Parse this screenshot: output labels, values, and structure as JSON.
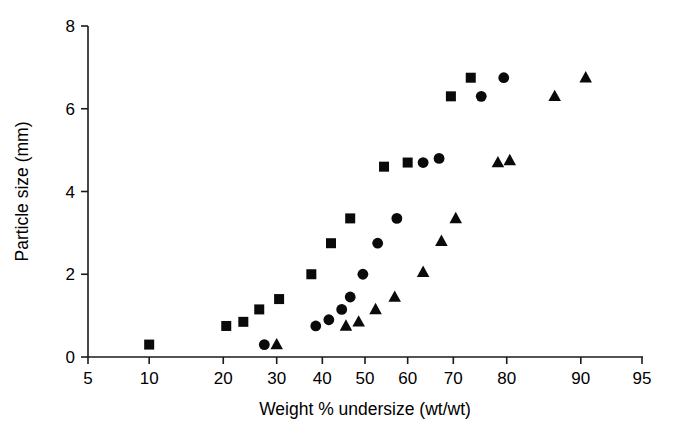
{
  "chart_data": {
    "type": "scatter",
    "title": "",
    "xlabel": "Weight % undersize (wt/wt)",
    "ylabel": "Particle size (mm)",
    "xscale": "probability",
    "xlim": [
      5,
      95
    ],
    "ylim": [
      0,
      8
    ],
    "xticks": [
      5,
      10,
      20,
      30,
      40,
      50,
      60,
      70,
      80,
      90,
      95
    ],
    "xticklabels": [
      "5",
      "10",
      "20",
      "30",
      "40",
      "50",
      "60",
      "70",
      "80",
      "90",
      "95"
    ],
    "yticks": [
      0,
      2,
      4,
      6,
      8
    ],
    "yticklabels": [
      "0",
      "2",
      "4",
      "6",
      "8"
    ],
    "grid": false,
    "legend": null,
    "series": [
      {
        "name": "square-series",
        "marker": "square",
        "color": "#0a0a0a",
        "points": [
          {
            "x": 10.0,
            "y": 0.3
          },
          {
            "x": 20.5,
            "y": 0.75
          },
          {
            "x": 23.5,
            "y": 0.85
          },
          {
            "x": 26.5,
            "y": 1.15
          },
          {
            "x": 30.5,
            "y": 1.4
          },
          {
            "x": 37.5,
            "y": 2.0
          },
          {
            "x": 42.0,
            "y": 2.75
          },
          {
            "x": 46.5,
            "y": 3.35
          },
          {
            "x": 54.5,
            "y": 4.6
          },
          {
            "x": 60.0,
            "y": 4.7
          },
          {
            "x": 69.5,
            "y": 6.3
          },
          {
            "x": 73.5,
            "y": 6.75
          }
        ]
      },
      {
        "name": "circle-series",
        "marker": "circle",
        "color": "#0a0a0a",
        "points": [
          {
            "x": 27.5,
            "y": 0.3
          },
          {
            "x": 38.5,
            "y": 0.75
          },
          {
            "x": 41.5,
            "y": 0.9
          },
          {
            "x": 44.5,
            "y": 1.15
          },
          {
            "x": 46.5,
            "y": 1.45
          },
          {
            "x": 49.5,
            "y": 2.0
          },
          {
            "x": 53.0,
            "y": 2.75
          },
          {
            "x": 57.5,
            "y": 3.35
          },
          {
            "x": 63.5,
            "y": 4.7
          },
          {
            "x": 67.0,
            "y": 4.8
          },
          {
            "x": 75.5,
            "y": 6.3
          },
          {
            "x": 79.5,
            "y": 6.75
          }
        ]
      },
      {
        "name": "triangle-series",
        "marker": "triangle",
        "color": "#0a0a0a",
        "points": [
          {
            "x": 30.0,
            "y": 0.3
          },
          {
            "x": 45.5,
            "y": 0.75
          },
          {
            "x": 48.5,
            "y": 0.85
          },
          {
            "x": 52.5,
            "y": 1.15
          },
          {
            "x": 57.0,
            "y": 1.45
          },
          {
            "x": 63.5,
            "y": 2.05
          },
          {
            "x": 67.5,
            "y": 2.8
          },
          {
            "x": 70.5,
            "y": 3.35
          },
          {
            "x": 78.5,
            "y": 4.7
          },
          {
            "x": 80.5,
            "y": 4.75
          },
          {
            "x": 87.0,
            "y": 6.3
          },
          {
            "x": 90.5,
            "y": 6.75
          }
        ]
      }
    ]
  }
}
